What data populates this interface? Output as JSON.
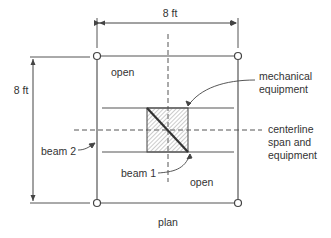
{
  "diagram": {
    "type": "structural plan",
    "caption": "plan",
    "dimensions": {
      "top": "8 ft",
      "left": "8 ft"
    },
    "labels": {
      "open_top_left": "open",
      "open_bottom_right": "open",
      "beam_1": "beam 1",
      "beam_2": "beam 2",
      "mechanical_equipment_line1": "mechanical",
      "mechanical_equipment_line2": "equipment",
      "centerline_line1": "centerline",
      "centerline_line2": "span and",
      "centerline_line3": "equipment"
    },
    "colors": {
      "line": "#555555",
      "hatch": "#999999",
      "text": "#333333"
    }
  }
}
